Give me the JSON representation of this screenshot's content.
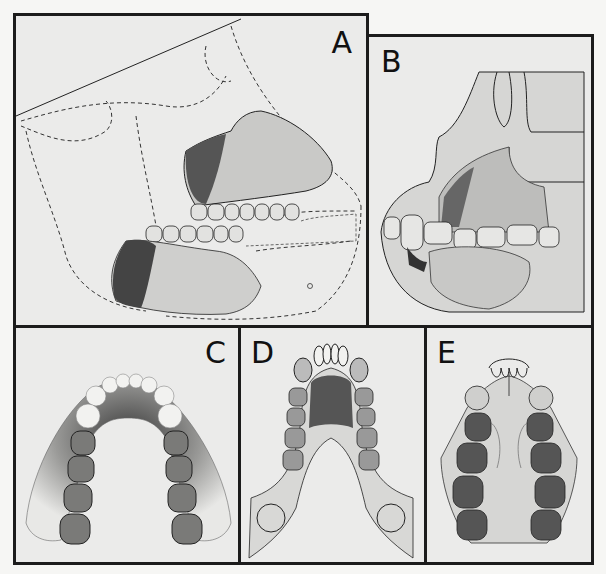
{
  "figure": {
    "panels": [
      {
        "id": "A",
        "label": "A",
        "description": "Lateral view of fossil jaw with reconstructed skull outline (dashed)"
      },
      {
        "id": "B",
        "label": "B",
        "description": "Lateral view of fossil maxilla and mandible in occlusion"
      },
      {
        "id": "C",
        "label": "C",
        "description": "Occlusal view of mandibular dental arcade"
      },
      {
        "id": "D",
        "label": "D",
        "description": "Occlusal view of reconstructed dental arcade"
      },
      {
        "id": "E",
        "label": "E",
        "description": "Occlusal view of palate with maxillary dentition"
      }
    ]
  }
}
